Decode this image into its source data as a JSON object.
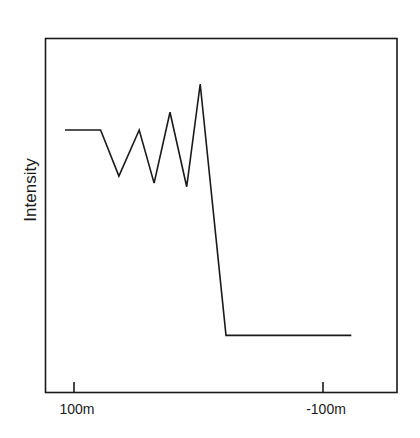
{
  "chart_data": {
    "type": "line",
    "title": "",
    "xlabel": "",
    "ylabel": "Intensity",
    "x_ticks": [
      {
        "label": "100m",
        "value": 100
      },
      {
        "label": "-100m",
        "value": -100
      }
    ],
    "x_axis_reversed": true,
    "xlim": [
      107,
      -123
    ],
    "ylim": [
      0,
      1
    ],
    "y_units": "relative (unlabeled)",
    "grid": false,
    "legend": null,
    "series": [
      {
        "name": "Intensity",
        "color": "#1a1a1a",
        "x": [
          107.2,
          78.6,
          63.9,
          47.6,
          35.7,
          22.9,
          9.5,
          -1.4,
          -22.1,
          -122.7
        ],
        "y": [
          0.74,
          0.74,
          0.61,
          0.74,
          0.59,
          0.79,
          0.58,
          0.87,
          0.16,
          0.16
        ]
      }
    ]
  },
  "colors": {
    "background": "#ffffff",
    "line": "#1a1a1a",
    "frame": "#1a1a1a"
  }
}
